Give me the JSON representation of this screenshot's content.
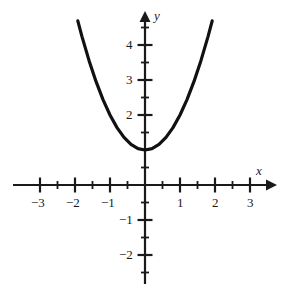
{
  "chart_data": {
    "type": "line",
    "title": "",
    "subtitle": "",
    "xlabel": "x",
    "ylabel": "y",
    "equation": "y = x^2 + 1",
    "xlim": [
      -3.6,
      3.6
    ],
    "ylim": [
      -2.6,
      4.9
    ],
    "grid": false,
    "legend": null,
    "axes": {
      "origin_label": "",
      "x_axis_arrow": true,
      "y_axis_arrow": true,
      "x_major_ticks": [
        -3,
        -2,
        -1,
        1,
        2,
        3
      ],
      "x_minor_ticks": [
        -2.5,
        -1.5,
        -0.5,
        0.5,
        1.5,
        2.5
      ],
      "y_major_ticks": [
        4,
        3,
        2,
        -1,
        -2
      ],
      "y_minor_ticks": [
        4.5,
        3.5,
        2.5,
        1.5,
        1,
        0.5,
        -0.5,
        -1.5,
        -2.5
      ],
      "x_tick_labels": [
        "−3",
        "−2",
        "−1",
        "1",
        "2",
        "3"
      ],
      "y_tick_labels": [
        "4",
        "3",
        "2",
        "−1",
        "−2"
      ]
    },
    "series": [
      {
        "name": "parabola",
        "color": "#111111",
        "points": [
          {
            "x": -1.92,
            "y": 4.69
          },
          {
            "x": -1.8,
            "y": 4.24
          },
          {
            "x": -1.6,
            "y": 3.56
          },
          {
            "x": -1.4,
            "y": 2.96
          },
          {
            "x": -1.2,
            "y": 2.44
          },
          {
            "x": -1.0,
            "y": 2.0
          },
          {
            "x": -0.8,
            "y": 1.64
          },
          {
            "x": -0.6,
            "y": 1.36
          },
          {
            "x": -0.4,
            "y": 1.16
          },
          {
            "x": -0.2,
            "y": 1.04
          },
          {
            "x": 0.0,
            "y": 1.0
          },
          {
            "x": 0.2,
            "y": 1.04
          },
          {
            "x": 0.4,
            "y": 1.16
          },
          {
            "x": 0.6,
            "y": 1.36
          },
          {
            "x": 0.8,
            "y": 1.64
          },
          {
            "x": 1.0,
            "y": 2.0
          },
          {
            "x": 1.2,
            "y": 2.44
          },
          {
            "x": 1.4,
            "y": 2.96
          },
          {
            "x": 1.6,
            "y": 3.56
          },
          {
            "x": 1.8,
            "y": 4.24
          },
          {
            "x": 1.92,
            "y": 4.69
          }
        ],
        "vertex": {
          "x": 0,
          "y": 1
        }
      }
    ]
  },
  "labels": {
    "x_axis_title": "x",
    "y_axis_title": "y",
    "x_neg3": "−3",
    "x_neg2": "−2",
    "x_neg1": "−1",
    "x_1": "1",
    "x_2": "2",
    "x_3": "3",
    "y_4": "4",
    "y_3": "3",
    "y_2": "2",
    "y_neg1": "−1",
    "y_neg2": "−2"
  },
  "colors": {
    "curve": "#111111",
    "axis": "#1a1a1a",
    "background": "#ffffff",
    "text": "#1a1a1a"
  }
}
